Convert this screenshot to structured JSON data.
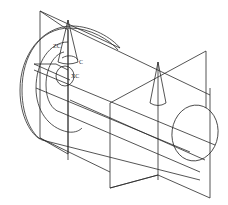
{
  "drawing": {
    "type": "CAD wireframe",
    "description": "Isometric wireframe of a stepped cylindrical shaft with two datum planes and cone direction markers",
    "labels": {
      "zc": "ZC",
      "xc": "XC",
      "c": "C"
    },
    "colors": {
      "background": "#ffffff",
      "line": "#2a2a2a"
    }
  }
}
